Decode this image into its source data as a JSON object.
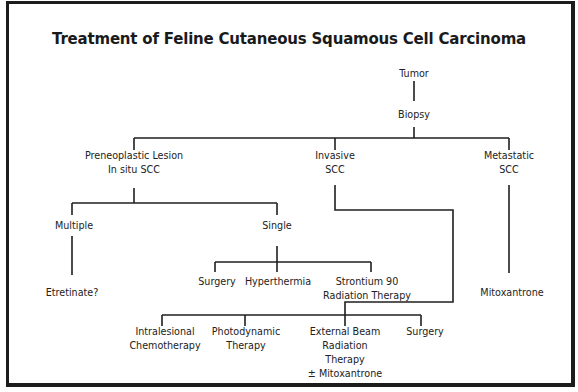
{
  "title": "Treatment of Feline Cutaneous Squamous Cell Carcinoma",
  "nodes": {
    "tumor": {
      "lines": [
        "Tumor"
      ]
    },
    "biopsy": {
      "lines": [
        "Biopsy"
      ]
    },
    "preneoplastic": {
      "lines": [
        "Preneoplastic Lesion",
        "In situ SCC"
      ]
    },
    "invasive": {
      "lines": [
        "Invasive",
        "SCC"
      ]
    },
    "metastatic": {
      "lines": [
        "Metastatic",
        "SCC"
      ]
    },
    "multiple": {
      "lines": [
        "Multiple"
      ]
    },
    "single": {
      "lines": [
        "Single"
      ]
    },
    "etretinate": {
      "lines": [
        "Etretinate?"
      ]
    },
    "surgery_single": {
      "lines": [
        "Surgery"
      ]
    },
    "hyperthermia": {
      "lines": [
        "Hyperthermia"
      ]
    },
    "strontium": {
      "lines": [
        "Strontium 90",
        "Radiation Therapy"
      ]
    },
    "mitoxantrone": {
      "lines": [
        "Mitoxantrone"
      ]
    },
    "intralesional": {
      "lines": [
        "Intralesional",
        "Chemotherapy"
      ]
    },
    "photodynamic": {
      "lines": [
        "Photodynamic",
        "Therapy"
      ]
    },
    "external_beam": {
      "lines": [
        "External Beam",
        "Radiation",
        "Therapy",
        "± Mitoxantrone"
      ]
    },
    "surgery_invasive": {
      "lines": [
        "Surgery"
      ]
    }
  },
  "edges": [
    [
      "tumor",
      "biopsy"
    ],
    [
      "biopsy",
      "preneoplastic"
    ],
    [
      "biopsy",
      "invasive"
    ],
    [
      "biopsy",
      "metastatic"
    ],
    [
      "preneoplastic",
      "multiple"
    ],
    [
      "preneoplastic",
      "single"
    ],
    [
      "multiple",
      "etretinate"
    ],
    [
      "single",
      "surgery_single"
    ],
    [
      "single",
      "hyperthermia"
    ],
    [
      "single",
      "strontium"
    ],
    [
      "invasive",
      "intralesional"
    ],
    [
      "invasive",
      "photodynamic"
    ],
    [
      "invasive",
      "external_beam"
    ],
    [
      "invasive",
      "surgery_invasive"
    ],
    [
      "metastatic",
      "mitoxantrone"
    ]
  ]
}
